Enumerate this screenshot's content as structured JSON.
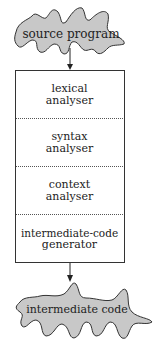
{
  "input": {
    "label": "source program"
  },
  "stages": [
    {
      "line1": "lexical",
      "line2": "analyser"
    },
    {
      "line1": "syntax",
      "line2": "analyser"
    },
    {
      "line1": "context",
      "line2": "analyser"
    },
    {
      "line1": "intermediate-code",
      "line2": "generator"
    }
  ],
  "output": {
    "label": "intermediate code"
  },
  "colors": {
    "blob_fill": "#c8c8c8",
    "stroke": "#333333"
  }
}
